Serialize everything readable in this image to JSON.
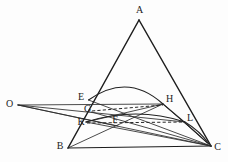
{
  "figure": {
    "background_color": "#fdfdfd",
    "ink_color": "#1d1d1d",
    "width": 228,
    "height": 162,
    "points": [
      {
        "id": "A",
        "label": "A",
        "x": 139.0,
        "y": 20.0,
        "label_x": 139.5,
        "label_y": 11.0
      },
      {
        "id": "B",
        "label": "B",
        "x": 68.0,
        "y": 148.0,
        "label_x": 60.0,
        "label_y": 147.0
      },
      {
        "id": "C",
        "label": "C",
        "x": 211.0,
        "y": 146.0,
        "label_x": 217.5,
        "label_y": 147.5
      },
      {
        "id": "O",
        "label": "O",
        "x": 18.0,
        "y": 105.0,
        "label_x": 9.5,
        "label_y": 104.5
      },
      {
        "id": "E",
        "label": "E",
        "x": 88.5,
        "y": 100.0,
        "label_x": 81.0,
        "label_y": 98.0
      },
      {
        "id": "G",
        "label": "G",
        "x": 91.5,
        "y": 112.0,
        "label_x": 87.5,
        "label_y": 110.0
      },
      {
        "id": "K",
        "label": "K",
        "x": 86.0,
        "y": 122.0,
        "label_x": 81.0,
        "label_y": 122.5
      },
      {
        "id": "F",
        "label": "F",
        "x": 118.0,
        "y": 123.0,
        "label_x": 115.0,
        "label_y": 120.5
      },
      {
        "id": "H",
        "label": "H",
        "x": 163.0,
        "y": 104.0,
        "label_x": 169.5,
        "label_y": 99.5
      },
      {
        "id": "L",
        "label": "L",
        "x": 185.0,
        "y": 122.0,
        "label_x": 190.0,
        "label_y": 118.5
      }
    ],
    "segments": [
      {
        "name": "side-AB",
        "kind": "main",
        "from": "A",
        "to": "B"
      },
      {
        "name": "side-AC",
        "kind": "main",
        "from": "A",
        "to": "C"
      },
      {
        "name": "side-BC",
        "kind": "base",
        "from": "B",
        "to": "C"
      },
      {
        "name": "chord-OE",
        "kind": "thin",
        "from": "O",
        "to": "E"
      },
      {
        "name": "chord-OG",
        "kind": "thin",
        "from": "O",
        "to": "G"
      },
      {
        "name": "chord-OK",
        "kind": "thin",
        "from": "O",
        "to": "K"
      },
      {
        "name": "chord-OC-upper",
        "kind": "thin",
        "from": "O",
        "to": "C"
      },
      {
        "name": "chord-EH",
        "kind": "thin",
        "from": "E",
        "to": "H"
      },
      {
        "name": "chord-KL",
        "kind": "thin",
        "from": "K",
        "to": "L"
      },
      {
        "name": "chord-EC",
        "kind": "thin",
        "from": "E",
        "to": "C"
      },
      {
        "name": "chord-KC",
        "kind": "thin",
        "from": "K",
        "to": "C"
      },
      {
        "name": "chord-GC",
        "kind": "thin",
        "from": "G",
        "to": "C"
      },
      {
        "name": "chord-HC",
        "kind": "thin",
        "from": "H",
        "to": "C"
      },
      {
        "name": "chord-BH",
        "kind": "thin",
        "from": "B",
        "to": "H"
      },
      {
        "name": "chord-GH-dashed",
        "kind": "dashed",
        "from": "G",
        "to": "H"
      },
      {
        "name": "chord-KL-dashed",
        "kind": "dashed",
        "from": "K",
        "to": "L"
      }
    ],
    "arcs": [
      {
        "name": "arc-EHC-upper",
        "kind": "curve",
        "from": "E",
        "ctrl_x": 128.0,
        "ctrl_y": 72.0,
        "to": "H",
        "tail_x": 207.0,
        "tail_y": 142.0,
        "tail_ctrl_x": 188.0,
        "tail_ctrl_y": 116.0
      },
      {
        "name": "arc-KFL-lower",
        "kind": "curve",
        "from": "K",
        "ctrl_x": 136.0,
        "ctrl_y": 107.0,
        "to": "L",
        "tail_x": 209.0,
        "tail_y": 144.0,
        "tail_ctrl_x": 200.0,
        "tail_ctrl_y": 131.0
      }
    ],
    "labels_note": "A at apex; B bottom-left; C bottom-right; O external left; E, G, K on side AB; F interior; H, L on side AC"
  }
}
